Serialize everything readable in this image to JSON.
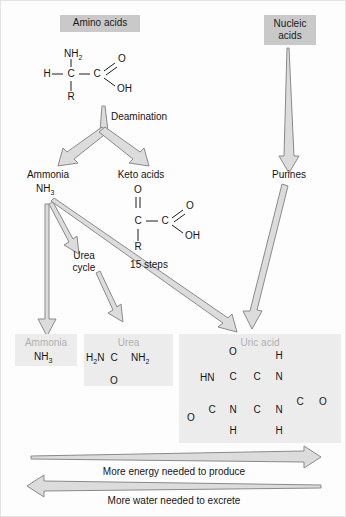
{
  "diagram": {
    "title_nodes": {
      "amino_acids": "Amino acids",
      "nucleic_acids": "Nucleic\nacids",
      "nucleic_acids_l1": "Nucleic",
      "nucleic_acids_l2": "acids"
    },
    "intermediate_nodes": {
      "ammonia": "Ammonia",
      "ammonia_formula": "NH3",
      "keto_acids": "Keto acids",
      "purines": "Purines",
      "urea_cycle_l1": "Urea",
      "urea_cycle_l2": "cycle"
    },
    "process_labels": {
      "deamination": "Deamination",
      "fifteen_steps": "15 steps"
    },
    "products": {
      "ammonia": {
        "name": "Ammonia",
        "formula": "NH3"
      },
      "urea": {
        "name": "Urea",
        "formula": "H2N - C - NH2",
        "carbonyl": "O"
      },
      "uric_acid": {
        "name": "Uric acid"
      }
    },
    "amino_acid_structure": {
      "h": "H",
      "c_alpha": "C",
      "c_carboxyl": "C",
      "nh2": "NH2",
      "r": "R",
      "o": "O",
      "oh": "OH"
    },
    "keto_acid_structure": {
      "o_top": "O",
      "c_alpha": "C",
      "c_carboxyl": "C",
      "r": "R",
      "o": "O",
      "oh": "OH"
    },
    "urea_structure": {
      "left": "H2N",
      "center": "C",
      "right": "NH2",
      "bottom_o": "O"
    },
    "uric_acid_structure": {
      "o_top": "O",
      "hn_left": "HN",
      "c_top_left": "C",
      "c_center_top": "C",
      "n_top_right": "N",
      "h_top_right": "H",
      "c_right": "C",
      "o_right": "O",
      "c_bottom_left": "C",
      "o_bottom_left": "O",
      "n_bottom_left": "N",
      "h_bottom_left": "H",
      "c_center_bottom": "C",
      "n_bottom_right": "N",
      "h_bottom_right": "H"
    },
    "axis_captions": {
      "energy": "More energy needed to produce",
      "water": "More water needed to excrete"
    },
    "colors": {
      "node_box": "#c9c9c9",
      "product_box": "#ececec",
      "arrow_fill": "#dcdcdc",
      "arrow_stroke": "#8a8a8a",
      "text": "#151515",
      "text_muted": "#b0b0b0",
      "background": "#fdfdfd"
    }
  }
}
